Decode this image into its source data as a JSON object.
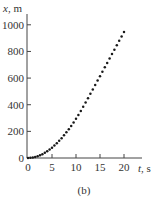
{
  "figure_label": "(b)",
  "chart_data": {
    "type": "scatter",
    "title": "",
    "xlabel": "t, s",
    "ylabel": "x, m",
    "xlim": [
      0,
      20
    ],
    "ylim": [
      0,
      1000
    ],
    "xticks": [
      0,
      5,
      10,
      15,
      20
    ],
    "yticks": [
      0,
      200,
      400,
      600,
      800,
      1000
    ],
    "grid": false,
    "legend": null,
    "series": [
      {
        "name": "position vs time",
        "marker": "dot",
        "color": "#1a1a1a",
        "x": [
          0,
          0.5,
          1,
          1.5,
          2,
          2.5,
          3,
          3.5,
          4,
          4.5,
          5,
          5.5,
          6,
          6.5,
          7,
          7.5,
          8,
          8.5,
          9,
          9.5,
          10,
          10.5,
          11,
          11.5,
          12,
          12.5,
          13,
          13.5,
          14,
          14.5,
          15,
          15.5,
          16,
          16.5,
          17,
          17.5,
          18,
          18.5,
          19,
          19.5,
          20
        ],
        "y": [
          0,
          1,
          3,
          7,
          12,
          18,
          26,
          35,
          46,
          58,
          70,
          85,
          100,
          117,
          135,
          154,
          175,
          196,
          218,
          242,
          266,
          292,
          320,
          348,
          377,
          406,
          436,
          466,
          496,
          526,
          556,
          586,
          616,
          646,
          676,
          706,
          736,
          766,
          796,
          826,
          856
        ]
      }
    ]
  }
}
